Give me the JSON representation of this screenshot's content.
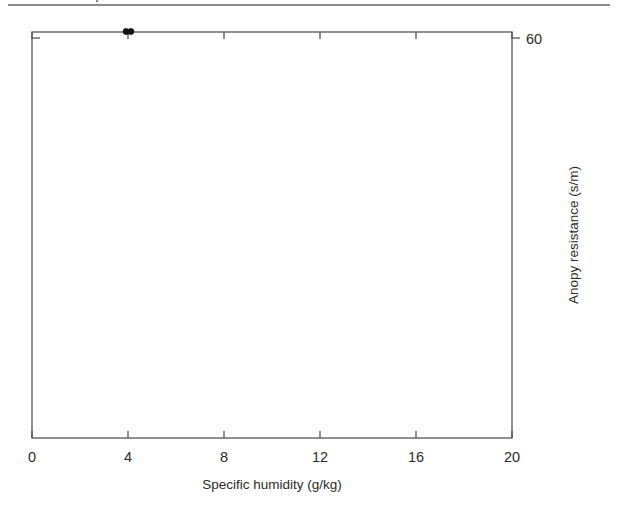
{
  "figure": {
    "top_rule_color": "#8a8a8a",
    "background": "#ffffff"
  },
  "chart_data": {
    "type": "scatter",
    "title": "",
    "xlabel": "Specific humidity (g/kg)",
    "ylabel": "Anopy resistance (s/m)",
    "xlim": [
      0,
      20
    ],
    "x_ticks": [
      0,
      4,
      8,
      12,
      16,
      20
    ],
    "x_tick_labels": [
      "0",
      "4",
      "8",
      "12",
      "16",
      "20"
    ],
    "y_axis_side": "right",
    "y_scale": "reciprocal",
    "y_ticks": [
      60,
      75,
      100,
      150,
      300,
      1000
    ],
    "y_tick_labels": [
      "60",
      "75",
      "100",
      "150",
      "300",
      "1000"
    ],
    "ylim_reciprocal": [
      0.0168,
      0.00095
    ],
    "grid": false,
    "legend": "none",
    "series": [
      {
        "name": "closed-circles",
        "marker": "filled-circle",
        "color": "#111111",
        "points": [
          [
            3.92,
            61
          ],
          [
            4.12,
            61
          ],
          [
            2.72,
            67
          ],
          [
            4.35,
            83
          ],
          [
            4.48,
            84
          ],
          [
            5.02,
            85
          ],
          [
            5.98,
            85
          ],
          [
            6.32,
            87
          ],
          [
            3.92,
            91
          ],
          [
            4.38,
            100
          ],
          [
            6.3,
            100
          ],
          [
            6.45,
            108
          ],
          [
            7.05,
            119
          ],
          [
            7.62,
            128
          ],
          [
            6.92,
            137
          ],
          [
            7.22,
            137
          ],
          [
            7.48,
            137
          ],
          [
            7.45,
            150
          ],
          [
            8.08,
            150
          ],
          [
            8.98,
            149
          ],
          [
            9.22,
            149
          ],
          [
            8.62,
            163
          ],
          [
            9.58,
            188
          ],
          [
            8.42,
            193
          ],
          [
            8.95,
            193
          ],
          [
            10.02,
            252
          ],
          [
            10.18,
            300
          ],
          [
            10.38,
            297
          ]
        ]
      },
      {
        "name": "open-circles",
        "marker": "open-circle",
        "color": "#1a1a1a",
        "points": [
          [
            4.28,
            84
          ],
          [
            3.85,
            100
          ],
          [
            4.02,
            108
          ],
          [
            3.35,
            130
          ],
          [
            4.22,
            130
          ],
          [
            4.42,
            137
          ],
          [
            3.42,
            143
          ],
          [
            6.18,
            100
          ],
          [
            6.42,
            118
          ],
          [
            3.88,
            150
          ],
          [
            4.98,
            143
          ],
          [
            5.52,
            150
          ],
          [
            5.78,
            153
          ],
          [
            5.92,
            150
          ],
          [
            6.02,
            152
          ],
          [
            7.32,
            137
          ],
          [
            7.42,
            143
          ],
          [
            7.58,
            148
          ],
          [
            8.18,
            160
          ],
          [
            8.25,
            158
          ],
          [
            4.52,
            160
          ],
          [
            5.62,
            165
          ],
          [
            6.12,
            163
          ],
          [
            6.48,
            170
          ],
          [
            6.62,
            173
          ],
          [
            7.02,
            178
          ],
          [
            7.48,
            172
          ],
          [
            7.62,
            180
          ],
          [
            8.02,
            182
          ],
          [
            8.55,
            180
          ],
          [
            8.72,
            186
          ],
          [
            9.25,
            173
          ],
          [
            9.42,
            178
          ],
          [
            5.08,
            190
          ],
          [
            5.72,
            188
          ],
          [
            6.18,
            193
          ],
          [
            6.55,
            196
          ],
          [
            6.82,
            200
          ],
          [
            7.18,
            190
          ],
          [
            7.85,
            200
          ],
          [
            8.35,
            205
          ],
          [
            8.62,
            210
          ],
          [
            9.05,
            200
          ],
          [
            9.62,
            196
          ],
          [
            4.72,
            212
          ],
          [
            5.88,
            215
          ],
          [
            6.22,
            222
          ],
          [
            6.48,
            228
          ],
          [
            6.72,
            232
          ],
          [
            7.28,
            222
          ],
          [
            7.62,
            235
          ],
          [
            8.05,
            228
          ],
          [
            8.42,
            240
          ],
          [
            8.82,
            245
          ],
          [
            9.18,
            230
          ],
          [
            9.38,
            243
          ],
          [
            9.82,
            235
          ],
          [
            6.62,
            255
          ],
          [
            7.05,
            262
          ],
          [
            7.88,
            268
          ],
          [
            8.32,
            272
          ],
          [
            8.72,
            278
          ],
          [
            9.02,
            268
          ],
          [
            9.52,
            280
          ],
          [
            9.88,
            300
          ],
          [
            10.02,
            300
          ],
          [
            10.12,
            310
          ],
          [
            10.22,
            302
          ],
          [
            10.32,
            312
          ],
          [
            10.45,
            330
          ],
          [
            10.62,
            300
          ],
          [
            10.82,
            330
          ],
          [
            11.05,
            330
          ],
          [
            11.18,
            330
          ],
          [
            11.42,
            400
          ],
          [
            11.52,
            320
          ],
          [
            11.82,
            330
          ],
          [
            11.92,
            500
          ],
          [
            12.05,
            520
          ],
          [
            12.18,
            430
          ],
          [
            12.32,
            430
          ],
          [
            12.42,
            480
          ],
          [
            12.52,
            500
          ],
          [
            11.78,
            350
          ],
          [
            12.22,
            350
          ],
          [
            10.95,
            260
          ],
          [
            11.12,
            430
          ],
          [
            11.95,
            560
          ],
          [
            13.02,
            430
          ],
          [
            13.55,
            360
          ],
          [
            13.72,
            350
          ],
          [
            13.88,
            360
          ],
          [
            14.02,
            365
          ],
          [
            14.12,
            370
          ],
          [
            14.22,
            380
          ],
          [
            13.62,
            560
          ],
          [
            14.12,
            700
          ],
          [
            14.02,
            900
          ],
          [
            14.42,
            1000
          ],
          [
            15.02,
            350
          ],
          [
            15.22,
            360
          ],
          [
            15.38,
            370
          ],
          [
            15.52,
            365
          ],
          [
            15.48,
            380
          ],
          [
            15.42,
            500
          ],
          [
            15.28,
            420
          ],
          [
            16.32,
            340
          ],
          [
            16.28,
            420
          ],
          [
            16.42,
            700
          ],
          [
            17.18,
            380
          ],
          [
            17.42,
            390
          ],
          [
            17.52,
            400
          ],
          [
            17.62,
            900
          ],
          [
            18.22,
            400
          ],
          [
            18.32,
            410
          ],
          [
            18.38,
            420
          ],
          [
            18.42,
            450
          ],
          [
            18.18,
            1000
          ],
          [
            18.92,
            340
          ],
          [
            19.02,
            400
          ],
          [
            10.52,
            260
          ],
          [
            10.72,
            265
          ],
          [
            9.72,
            275
          ],
          [
            3.22,
            150
          ],
          [
            3.28,
            168
          ],
          [
            3.58,
            190
          ]
        ]
      }
    ],
    "fit_lines": [
      {
        "name": "closed-circle-regression",
        "x_start": 2.68,
        "y_start": 66,
        "x_end": 10.35,
        "y_end": 305
      },
      {
        "name": "open-circle-regression-steep",
        "x_start": 3.1,
        "y_start": 128,
        "x_end": 10.3,
        "y_end": 392
      },
      {
        "name": "open-circle-regression-flat",
        "x_start": 10.35,
        "y_start": 420,
        "x_end": 19.05,
        "y_end": 500
      }
    ]
  }
}
